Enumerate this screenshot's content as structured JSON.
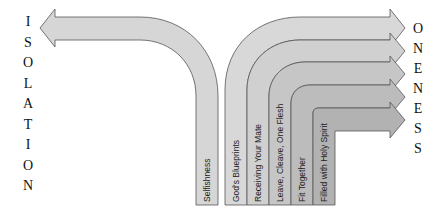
{
  "left_word": [
    "I",
    "S",
    "O",
    "L",
    "A",
    "T",
    "I",
    "O",
    "N"
  ],
  "right_word": [
    "O",
    "N",
    "E",
    "N",
    "E",
    "S",
    "S"
  ],
  "left_arrow": {
    "label": "Selfishness"
  },
  "right_arrows": [
    {
      "label": "God's Blueprints"
    },
    {
      "label": "Receiving Your Mate"
    },
    {
      "label": "Leave, Cleave, One Flesh"
    },
    {
      "label": "Fit Together"
    },
    {
      "label": "Filled with Holy Spirit"
    }
  ],
  "colors": {
    "fill1": "#dcdcdc",
    "fill2": "#d2d2d2",
    "fill3": "#c8c8c8",
    "fill4": "#bebebe",
    "fill5": "#b4b4b4",
    "fill6": "#aaaaaa",
    "stroke": "#555555"
  }
}
